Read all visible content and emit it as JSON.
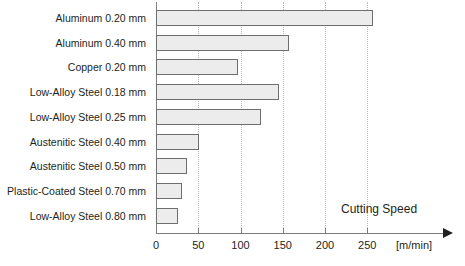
{
  "chart_data": {
    "type": "bar",
    "orientation": "horizontal",
    "title": "",
    "xlabel": "Cutting Speed",
    "ylabel": "",
    "unit_label": "[m/min]",
    "xlim": [
      0,
      290
    ],
    "xticks": [
      0,
      50,
      100,
      150,
      200,
      250
    ],
    "xtick_labels": [
      "0",
      "50",
      "100",
      "150",
      "200",
      "250"
    ],
    "grid": "vertical-dotted",
    "legend": "none",
    "categories": [
      "Aluminum 0.20 mm",
      "Aluminum 0.40 mm",
      "Copper 0.20 mm",
      "Low-Alloy Steel 0.18 mm",
      "Low-Alloy Steel 0.25 mm",
      "Austenitic Steel 0.40 mm",
      "Austenitic Steel 0.50 mm",
      "Plastic-Coated Steel 0.70 mm",
      "Low-Alloy Steel 0.80 mm"
    ],
    "values": [
      257,
      157,
      97,
      145,
      124,
      51,
      37,
      31,
      26
    ],
    "bar_fill": "#ececec",
    "bar_border": "#6e6e6e",
    "grid_color": "#b9b9b9",
    "axis_color": "#7d7d7d",
    "text_color": "#231f20",
    "background": "#ffffff"
  }
}
